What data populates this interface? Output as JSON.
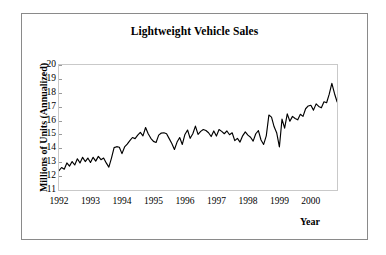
{
  "figure": {
    "background_color": "#ffffff",
    "frame_color": "#8a8a8a",
    "plot_border_color": "#c9c9c9",
    "line_color": "#000000"
  },
  "chart_data": {
    "type": "line",
    "title": "Lightweight Vehicle Sales",
    "xlabel": "Year",
    "ylabel": "Millions of Units (Annualized)",
    "ylim": [
      11,
      20
    ],
    "ytick_labels": [
      "20",
      "19",
      "18",
      "17",
      "16",
      "15",
      "14",
      "13",
      "12",
      "11"
    ],
    "yticks": [
      20,
      19,
      18,
      17,
      16,
      15,
      14,
      13,
      12,
      11
    ],
    "xtick_labels": [
      "1992",
      "1993",
      "1994",
      "1995",
      "1996",
      "1997",
      "1998",
      "1999",
      "2000"
    ],
    "xticks": [
      1992,
      1993,
      1994,
      1995,
      1996,
      1997,
      1998,
      1999,
      2000
    ],
    "xlim": [
      1992.0,
      2000.83
    ],
    "x_minor_ticks": "monthly",
    "grid": false,
    "legend": "none",
    "series": [
      {
        "name": "Lightweight Vehicle Sales (SAAR)",
        "x_start": "1992-01",
        "x_step_months": 1,
        "values": [
          12.4,
          12.62,
          12.5,
          12.95,
          12.72,
          13.05,
          12.8,
          13.25,
          12.95,
          13.35,
          13.05,
          13.3,
          12.98,
          13.35,
          13.08,
          13.42,
          13.18,
          13.3,
          12.95,
          12.65,
          13.3,
          14.05,
          14.12,
          14.08,
          13.62,
          14.1,
          14.3,
          14.55,
          14.78,
          14.7,
          14.95,
          15.15,
          14.9,
          15.5,
          15.05,
          14.72,
          14.5,
          14.42,
          14.95,
          15.1,
          15.12,
          15.05,
          14.7,
          14.35,
          13.92,
          14.45,
          14.78,
          14.28,
          15.0,
          15.32,
          14.72,
          15.05,
          15.6,
          15.0,
          15.22,
          15.35,
          15.28,
          15.12,
          14.85,
          15.25,
          14.88,
          15.35,
          15.22,
          15.05,
          15.25,
          14.98,
          15.12,
          14.55,
          14.72,
          14.45,
          14.9,
          15.18,
          14.95,
          14.8,
          14.52,
          15.05,
          15.28,
          14.6,
          14.28,
          14.9,
          16.4,
          16.25,
          15.55,
          15.1,
          14.1,
          16.1,
          15.45,
          16.48,
          15.95,
          16.3,
          16.15,
          16.05,
          16.45,
          16.3,
          16.85,
          17.05,
          17.1,
          16.75,
          17.2,
          17.02,
          16.92,
          17.35,
          17.28,
          17.9,
          18.68,
          17.95,
          17.35,
          17.02,
          16.95,
          18.08,
          17.05,
          16.45,
          15.88
        ]
      }
    ],
    "notable_points": {
      "start_value": 12.4,
      "peak_value": 18.68,
      "peak_period": "2000",
      "strike_dip_value": 14.1,
      "strike_dip_period": "1998",
      "end_value": 15.88
    }
  }
}
